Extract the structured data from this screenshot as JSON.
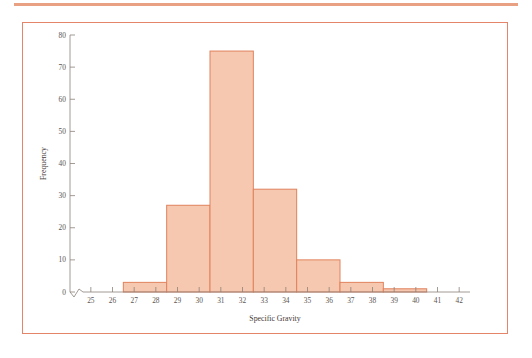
{
  "figure": {
    "frame_color": "#e4856a",
    "rule_color": "#e8a183",
    "background": "#ffffff"
  },
  "chart_data": {
    "type": "bar",
    "title": "",
    "subtitle": "",
    "xlabel": "Specific Gravity",
    "ylabel": "Frequency",
    "xlim": [
      24.5,
      42.5
    ],
    "ylim": [
      0,
      80
    ],
    "grid": false,
    "legend": null,
    "bar_fill_color": "#f7c8b0",
    "bar_stroke_color": "#e0825c",
    "axis_break": true,
    "bin_width": 2,
    "x_tick_labels": [
      "25",
      "26",
      "27",
      "28",
      "29",
      "30",
      "31",
      "32",
      "33",
      "34",
      "35",
      "36",
      "37",
      "38",
      "39",
      "40",
      "41",
      "42"
    ],
    "x_tick_values": [
      25,
      26,
      27,
      28,
      29,
      30,
      31,
      32,
      33,
      34,
      35,
      36,
      37,
      38,
      39,
      40,
      41,
      42
    ],
    "y_tick_labels": [
      "0",
      "10",
      "20",
      "30",
      "40",
      "50",
      "60",
      "70",
      "80"
    ],
    "y_tick_values": [
      0,
      10,
      20,
      30,
      40,
      50,
      60,
      70,
      80
    ],
    "bins": [
      {
        "left": 26.5,
        "right": 28.5,
        "center": 27.5,
        "value": 3
      },
      {
        "left": 28.5,
        "right": 30.5,
        "center": 29.5,
        "value": 27
      },
      {
        "left": 30.5,
        "right": 32.5,
        "center": 31.5,
        "value": 75
      },
      {
        "left": 32.5,
        "right": 34.5,
        "center": 33.5,
        "value": 32
      },
      {
        "left": 34.5,
        "right": 36.5,
        "center": 35.5,
        "value": 10
      },
      {
        "left": 36.5,
        "right": 38.5,
        "center": 37.5,
        "value": 3
      },
      {
        "left": 38.5,
        "right": 40.5,
        "center": 39.5,
        "value": 1
      }
    ],
    "categories": [
      "26.5-28.5",
      "28.5-30.5",
      "30.5-32.5",
      "32.5-34.5",
      "34.5-36.5",
      "36.5-38.5",
      "38.5-40.5"
    ],
    "values": [
      3,
      27,
      75,
      32,
      10,
      3,
      1
    ]
  }
}
